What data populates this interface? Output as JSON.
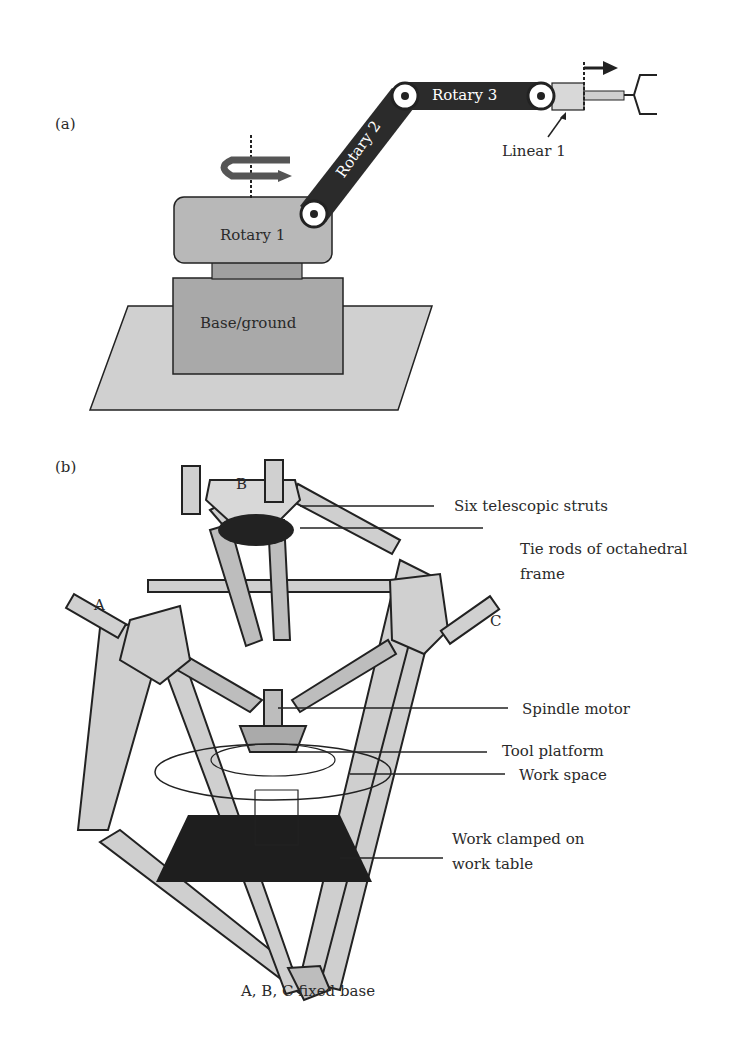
{
  "figure": {
    "panel_a": {
      "label": "(a)",
      "joints": {
        "rotary1": "Rotary 1",
        "rotary2": "Rotary 2",
        "rotary3": "Rotary 3",
        "linear1": "Linear 1",
        "base": "Base/ground"
      },
      "colors": {
        "dark_link": "#2b2b2b",
        "body": "#b8b8b8",
        "base": "#a9a9a9",
        "ground": "#d0d0d0"
      }
    },
    "panel_b": {
      "label": "(b)",
      "nodes": {
        "a": "A",
        "b": "B",
        "c": "C"
      },
      "callouts": {
        "struts": "Six telescopic struts",
        "tie_rods_1": "Tie rods of octahedral",
        "tie_rods_2": "frame",
        "spindle": "Spindle motor",
        "tool_platform": "Tool platform",
        "work_space": "Work space",
        "work_clamped_1": "Work clamped on",
        "work_clamped_2": "work table"
      },
      "caption": "A, B, C fixed base"
    }
  }
}
